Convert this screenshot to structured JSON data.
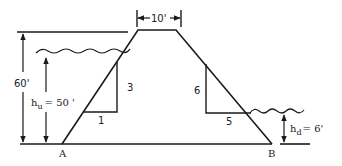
{
  "diagram": {
    "type": "earth-dam-cross-section",
    "crest": {
      "width_label": "10'"
    },
    "dam_height": {
      "label": "60'"
    },
    "upstream": {
      "water_depth_label_prefix": "h",
      "water_depth_label_sub": "u",
      "water_depth_value": "= 50 '",
      "slope": {
        "vertical": "3",
        "horizontal": "1"
      }
    },
    "downstream": {
      "water_depth_label_prefix": "h",
      "water_depth_label_sub": "d",
      "water_depth_value": "= 6'",
      "slope": {
        "vertical": "6",
        "horizontal": "5"
      }
    },
    "points": {
      "toe_upstream": "A",
      "toe_downstream": "B"
    },
    "colors": {
      "line": "#1a1a1a",
      "background": "#ffffff"
    }
  }
}
